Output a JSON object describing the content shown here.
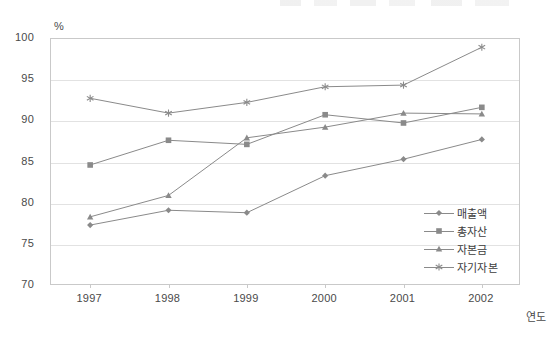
{
  "chart_data": {
    "type": "line",
    "title": "",
    "xlabel": "연도",
    "ylabel": "%",
    "unit_label": "%",
    "categories": [
      "1997",
      "1998",
      "1999",
      "2000",
      "2001",
      "2002"
    ],
    "ylim": [
      70,
      100
    ],
    "yticks": [
      70,
      75,
      80,
      85,
      90,
      95,
      100
    ],
    "grid": true,
    "legend_position": "inside-bottom-right",
    "series": [
      {
        "name": "매출액",
        "marker": "diamond",
        "color": "#8a8a8a",
        "values": [
          77.4,
          79.2,
          78.9,
          83.4,
          85.4,
          87.8
        ]
      },
      {
        "name": "총자산",
        "marker": "square",
        "color": "#8a8a8a",
        "values": [
          84.7,
          87.7,
          87.2,
          90.8,
          89.8,
          91.7
        ]
      },
      {
        "name": "자본금",
        "marker": "triangle",
        "color": "#8a8a8a",
        "values": [
          78.4,
          81.0,
          88.0,
          89.3,
          91.0,
          90.9
        ]
      },
      {
        "name": "자기자본",
        "marker": "asterisk",
        "color": "#8a8a8a",
        "values": [
          92.8,
          91.0,
          92.3,
          94.2,
          94.4,
          99.0
        ]
      }
    ]
  }
}
